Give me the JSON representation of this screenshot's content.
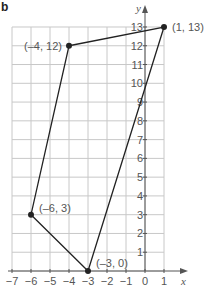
{
  "panel_label": "b",
  "chart_data": {
    "type": "line",
    "title": "",
    "xlabel": "x",
    "ylabel": "y",
    "xlim": [
      -7,
      1
    ],
    "ylim": [
      0,
      13
    ],
    "grid": true,
    "x_ticks": [
      -7,
      -6,
      -5,
      -4,
      -3,
      -2,
      -1,
      0,
      1
    ],
    "y_ticks": [
      1,
      2,
      3,
      4,
      5,
      6,
      7,
      8,
      9,
      10,
      11,
      12,
      13
    ],
    "series": [
      {
        "name": "quadrilateral",
        "closed": true,
        "points": [
          {
            "x": -4,
            "y": 12,
            "label": "(–4, 12)"
          },
          {
            "x": 1,
            "y": 13,
            "label": "(1, 13)"
          },
          {
            "x": -3,
            "y": 0,
            "label": "(–3, 0)"
          },
          {
            "x": -6,
            "y": 3,
            "label": "(–6, 3)"
          }
        ]
      }
    ]
  },
  "style": {
    "grid_color": "#c8c8c8",
    "axis_color": "#555555",
    "line_color": "#222222",
    "text_color": "#555555"
  }
}
